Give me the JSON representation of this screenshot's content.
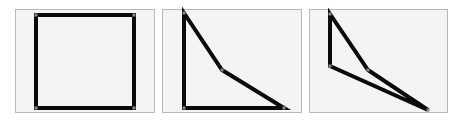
{
  "figure": {
    "panels": [
      {
        "name": "square",
        "box": [
          15,
          9,
          140,
          104
        ],
        "points": [
          [
            36,
            15
          ],
          [
            134,
            15
          ],
          [
            134,
            108
          ],
          [
            36,
            108
          ]
        ],
        "closed": true
      },
      {
        "name": "quad-triangle",
        "box": [
          162,
          9,
          140,
          104
        ],
        "points": [
          [
            184,
            13
          ],
          [
            222,
            70
          ],
          [
            284,
            108
          ],
          [
            184,
            108
          ]
        ],
        "closed": true
      },
      {
        "name": "deformed-shape",
        "box": [
          309,
          9,
          139,
          104
        ],
        "points": [
          [
            330,
            14
          ],
          [
            368,
            70
          ],
          [
            428,
            110
          ],
          [
            330,
            66
          ]
        ],
        "closed": true
      }
    ],
    "stroke_color": "#0a0a0a",
    "stroke_width": 4,
    "panel_bg": "#f4f4f4",
    "panel_border": "#b8b8b8",
    "vertex_color": "#888888"
  }
}
